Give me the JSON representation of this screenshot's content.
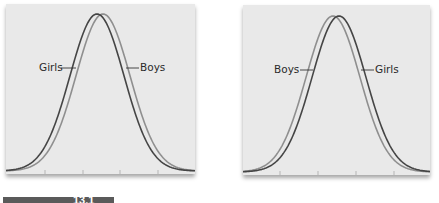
{
  "chart_data": [
    {
      "type": "line",
      "title": "",
      "xlabel": "",
      "ylabel": "",
      "grid": false,
      "legend": "inline labels",
      "x_ticks": 4,
      "series": [
        {
          "name": "Girls",
          "description": "normal curve, mean slightly left",
          "mean_offset": -0.15,
          "color": "#4a4a4a"
        },
        {
          "name": "Boys",
          "description": "normal curve, mean slightly right",
          "mean_offset": 0.15,
          "color": "#8a8a8a"
        }
      ],
      "labels": {
        "left": "Girls",
        "right": "Boys"
      }
    },
    {
      "type": "line",
      "title": "",
      "xlabel": "",
      "ylabel": "",
      "grid": false,
      "legend": "inline labels",
      "x_ticks": 4,
      "series": [
        {
          "name": "Boys",
          "description": "normal curve, mean slightly left",
          "mean_offset": -0.15,
          "color": "#8a8a8a"
        },
        {
          "name": "Girls",
          "description": "normal curve, mean slightly right",
          "mean_offset": 0.15,
          "color": "#4a4a4a"
        }
      ],
      "labels": {
        "left": "Boys",
        "right": "Girls"
      }
    }
  ],
  "figure_label": "13.1"
}
